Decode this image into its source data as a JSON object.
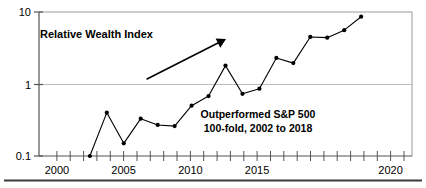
{
  "chart_data": {
    "type": "line",
    "title": "",
    "subtitle": "",
    "xlabel": "",
    "ylabel": "",
    "yscale": "log",
    "ylim": [
      0.1,
      10
    ],
    "xlim": [
      1999,
      2021
    ],
    "grid": true,
    "legend_position": "none",
    "y_tick_labels": [
      "10",
      "1",
      "0.1"
    ],
    "y_tick_values": [
      10,
      1,
      0.1
    ],
    "x_tick_labels": [
      "2000",
      "2005",
      "2010",
      "2015",
      "2020"
    ],
    "x_tick_values": [
      2000,
      2005,
      2010,
      2015,
      2020
    ],
    "x_minor_tick_step": 1,
    "series": [
      {
        "name": "Relative Wealth Index",
        "marker": "filled-circle",
        "color": "#000000",
        "x": [
          2002,
          2003,
          2004,
          2005,
          2006,
          2007,
          2008,
          2009,
          2010,
          2011,
          2012,
          2013,
          2014,
          2015,
          2016,
          2017,
          2018
        ],
        "values": [
          0.1,
          0.4,
          0.15,
          0.33,
          0.27,
          0.26,
          0.5,
          0.68,
          1.8,
          0.73,
          0.86,
          2.3,
          1.95,
          4.5,
          4.4,
          5.6,
          8.6
        ]
      }
    ],
    "annotations": [
      {
        "name": "series-label",
        "text": "Relative Wealth Index",
        "x_px": 40,
        "y_px": 38
      },
      {
        "name": "performance-note-line-1",
        "text": "Outperformed S&P 500",
        "x_px": 258,
        "y_px": 118
      },
      {
        "name": "performance-note-line-2",
        "text": "100-fold, 2002 to 2018",
        "x_px": 258,
        "y_px": 132
      }
    ],
    "arrow": {
      "name": "trend-arrow",
      "from_px": [
        147,
        79
      ],
      "to_px": [
        226,
        39
      ],
      "style": "solid-filled-head"
    }
  },
  "colors": {
    "line": "#000000",
    "marker": "#000000",
    "axis": "#555555",
    "grid": "#b8b8b8",
    "frame": "#8a8a8a",
    "rule": "#3a3a3a",
    "background": "#ffffff"
  }
}
